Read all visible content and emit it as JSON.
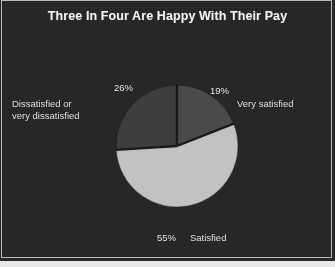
{
  "figure": {
    "title": "Three In Four Are Happy With Their Pay",
    "background_color": "#272727",
    "border_color": "#b9b9b9",
    "title_color": "#f4f4f4"
  },
  "chart_data": {
    "type": "pie",
    "title": "Three In Four Are Happy With Their Pay",
    "xlabel": "",
    "ylabel": "",
    "legend": "none",
    "grid": false,
    "start_angle_deg": 0,
    "direction": "clockwise",
    "center": {
      "x": 177,
      "y": 146
    },
    "radius": 61,
    "categories": [
      "Very satisfied",
      "Satisfied",
      "Dissatisfied or very dissatisfied"
    ],
    "values": [
      19,
      55,
      26
    ],
    "unit": "%",
    "slices": [
      {
        "label": "Very satisfied",
        "value": 19,
        "value_label": "19%",
        "color": "#4a4a4a",
        "start_deg": 0,
        "end_deg": 68.4
      },
      {
        "label": "Satisfied",
        "value": 55,
        "value_label": "55%",
        "color": "#c2c2c2",
        "start_deg": 68.4,
        "end_deg": 266.4
      },
      {
        "label": "Dissatisfied or very dissatisfied",
        "value": 26,
        "value_label": "26%",
        "color": "#3e3e3e",
        "start_deg": 266.4,
        "end_deg": 360
      }
    ],
    "divider_color": "#1a1a1a"
  },
  "labels": {
    "dissatisfied_text": "Dissatisfied or\nvery dissatisfied",
    "dissatisfied_pct": "26%",
    "very_satisfied_text": "Very satisfied",
    "very_satisfied_pct": "19%",
    "satisfied_text": "Satisfied",
    "satisfied_pct": "55%"
  }
}
